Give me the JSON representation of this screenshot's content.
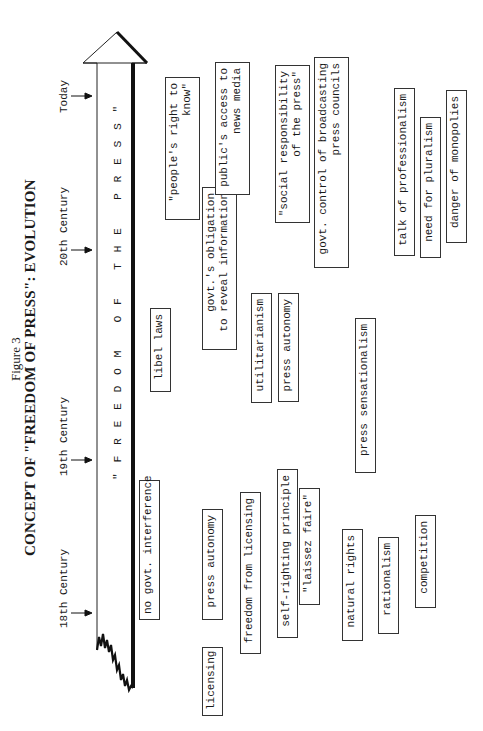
{
  "figure": {
    "label": "Figure 3",
    "title": "CONCEPT OF \"FREEDOM OF PRESS\": EVOLUTION"
  },
  "timeline": {
    "eras": [
      "18th Century",
      "19th Century",
      "20th Century",
      "Today"
    ],
    "banner": "\"FREEDOM OF THE PRESS\""
  },
  "concepts": [
    {
      "id": "no-govt-interference",
      "lines": [
        "no govt. interference"
      ]
    },
    {
      "id": "licensing",
      "lines": [
        "licensing"
      ]
    },
    {
      "id": "press-autonomy-1",
      "lines": [
        "press autonomy"
      ]
    },
    {
      "id": "freedom-from-licensing",
      "lines": [
        "freedom from licensing"
      ]
    },
    {
      "id": "self-righting-principle",
      "lines": [
        "self-righting principle"
      ]
    },
    {
      "id": "laissez-faire",
      "lines": [
        "\"laissez faire\""
      ]
    },
    {
      "id": "natural-rights",
      "lines": [
        "natural rights"
      ]
    },
    {
      "id": "rationalism",
      "lines": [
        "rationalism"
      ]
    },
    {
      "id": "competition",
      "lines": [
        "competition"
      ]
    },
    {
      "id": "libel-laws",
      "lines": [
        "libel laws"
      ]
    },
    {
      "id": "govt-obligation",
      "lines": [
        "govt.'s obligation",
        "to reveal information"
      ]
    },
    {
      "id": "utilitarianism",
      "lines": [
        "utilitarianism"
      ]
    },
    {
      "id": "press-autonomy-2",
      "lines": [
        "press autonomy"
      ]
    },
    {
      "id": "press-sensationalism",
      "lines": [
        "press sensationalism"
      ]
    },
    {
      "id": "peoples-right-to-know",
      "lines": [
        "\"people's right to",
        "know\""
      ]
    },
    {
      "id": "publics-access",
      "lines": [
        "public's access to",
        "news media"
      ]
    },
    {
      "id": "social-responsibility",
      "lines": [
        "\"social responsibility",
        "of the press\""
      ]
    },
    {
      "id": "govt-control-broadcasting",
      "lines": [
        "govt. control of broadcasting",
        "press councils"
      ]
    },
    {
      "id": "talk-of-professionalism",
      "lines": [
        "talk of professionalism"
      ]
    },
    {
      "id": "need-for-pluralism",
      "lines": [
        "need for pluralism"
      ]
    },
    {
      "id": "danger-of-monopolies",
      "lines": [
        "danger of monopolies"
      ]
    }
  ],
  "colors": {
    "ink": "#1a1a1a",
    "paper": "#ffffff"
  }
}
